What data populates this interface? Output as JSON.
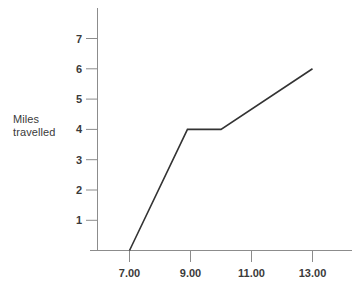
{
  "chart_data": {
    "type": "line",
    "title": "",
    "subtitle": "",
    "xlabel": "",
    "ylabel": "Miles\ntravelled",
    "ylabel_lines": [
      "Miles",
      "travelled"
    ],
    "x": [
      7.0,
      8.9,
      10.0,
      13.0
    ],
    "y": [
      0,
      4,
      4,
      6
    ],
    "series": [
      {
        "name": "Journey",
        "points": [
          {
            "x": 7.0,
            "y": 0
          },
          {
            "x": 8.9,
            "y": 4
          },
          {
            "x": 10.0,
            "y": 4
          },
          {
            "x": 13.0,
            "y": 6
          }
        ]
      }
    ],
    "xtick_labels": [
      "7.00",
      "9.00",
      "11.00",
      "13.00"
    ],
    "xtick_values": [
      7,
      9,
      11,
      13
    ],
    "ytick_labels": [
      "1",
      "2",
      "3",
      "4",
      "5",
      "6",
      "7"
    ],
    "ytick_values": [
      1,
      2,
      3,
      4,
      5,
      6,
      7
    ],
    "xlim": [
      5.1,
      14.2
    ],
    "ylim": [
      0,
      7.85
    ],
    "grid": false,
    "legend": false,
    "legend_position": "none",
    "annotations": [],
    "colors": {
      "line": "#333333",
      "axis": "#8c8c8c",
      "tick_mark": "#8c8c8c",
      "text": "#3a3a3a",
      "background": "#ffffff"
    },
    "line_width": 1.6,
    "axis_line_width": 1.0
  }
}
